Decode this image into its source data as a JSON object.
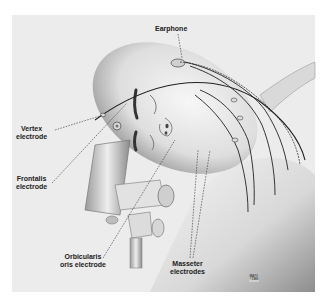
{
  "figure": {
    "labels": {
      "earphone": "Earphone",
      "vertex": [
        "Vertex",
        "electrode"
      ],
      "frontalis": [
        "Frontalis",
        "electrode"
      ],
      "orbicularis": [
        "Orbicularis",
        "oris electrode"
      ],
      "masseter": [
        "Masseter",
        "electrodes"
      ]
    },
    "signature": [
      "MAYO",
      "©1990"
    ]
  },
  "colors": {
    "background": "#ffffff",
    "panel": "#ececec",
    "ink": "#222222",
    "skin_light": "#f2f2f2",
    "skin_shade": "#b9b9b9"
  }
}
